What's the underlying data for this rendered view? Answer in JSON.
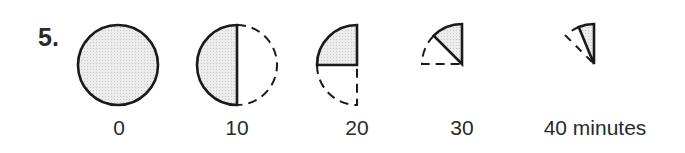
{
  "question": {
    "number": "5."
  },
  "figure": {
    "fill_color": "#e6e6e6",
    "stroke_color": "#1a1a1a",
    "stages": [
      {
        "time_label": "0",
        "fraction_remaining": "1"
      },
      {
        "time_label": "10",
        "fraction_remaining": "1/2"
      },
      {
        "time_label": "20",
        "fraction_remaining": "1/4"
      },
      {
        "time_label": "30",
        "fraction_remaining": "1/8"
      },
      {
        "time_label": "40 minutes",
        "fraction_remaining": "1/16"
      }
    ]
  }
}
